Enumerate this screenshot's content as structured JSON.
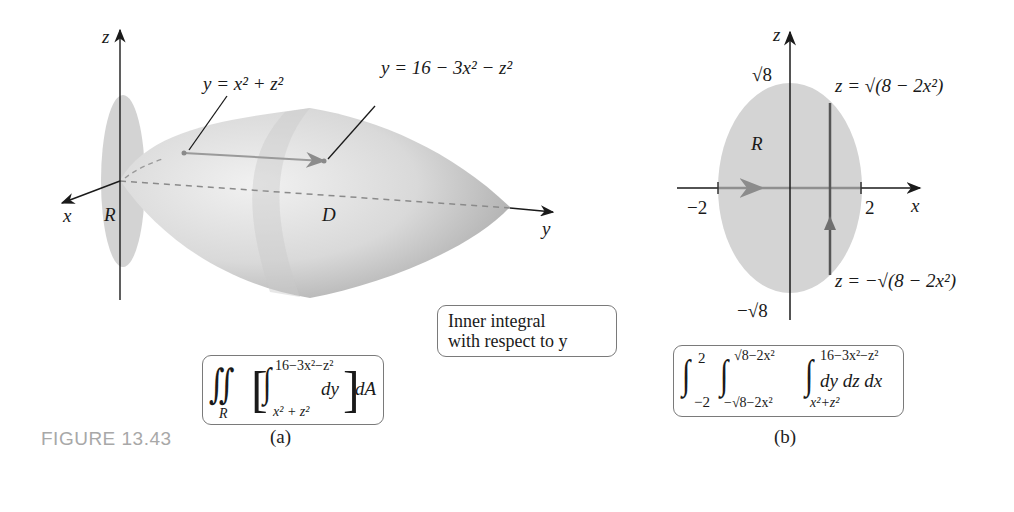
{
  "figure": {
    "label": "FIGURE 13.43",
    "panels": [
      {
        "id": "a",
        "caption": "(a)",
        "axes": {
          "z": "z",
          "x": "x",
          "y": "y"
        },
        "region_label": "R",
        "solid_label": "D",
        "surface_lower": "y = x² + z²",
        "surface_upper": "y = 16 − 3x² − z²",
        "note": {
          "line1": "Inner integral",
          "line2": "with respect to y"
        },
        "integral": {
          "outer": "∬",
          "outer_sub": "R",
          "inner_upper": "16−3x²−z²",
          "inner_lower": "x² + z²",
          "inner_integrand": "dy",
          "outer_differential": "dA"
        }
      },
      {
        "id": "b",
        "caption": "(b)",
        "axes": {
          "z": "z",
          "x": "x"
        },
        "region_label": "R",
        "ticks": {
          "x_neg": "−2",
          "x_pos": "2",
          "z_pos": "√8",
          "z_neg": "−√8"
        },
        "boundary_upper": "z = √(8 − 2x²)",
        "boundary_lower": "z = −√(8 − 2x²)",
        "integral": {
          "x_lower": "−2",
          "x_upper": "2",
          "z_lower": "−√8−2x²",
          "z_upper": "√8−2x²",
          "y_lower": "x²+z²",
          "y_upper": "16−3x²−z²",
          "integrand": "dy dz dx"
        }
      }
    ],
    "colors": {
      "region_fill": "#d4d4d4",
      "solid_light": "#ececec",
      "solid_dark": "#a9a9a9",
      "axis": "#1a1a1a",
      "figure_label": "#a8a8a8"
    }
  }
}
